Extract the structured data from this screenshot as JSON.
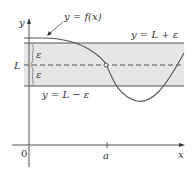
{
  "diagram": {
    "labels": {
      "curve": "y = f(x)",
      "upper": "y = L + ε",
      "lower": "y = L − ε",
      "limit": "L",
      "epsilon_top": "ε",
      "epsilon_bottom": "ε",
      "y_axis": "y",
      "x_axis": "x",
      "origin": "0",
      "a": "a"
    },
    "colors": {
      "band_fill": "#e6e6e6",
      "line": "#555555",
      "text": "#333333"
    }
  }
}
